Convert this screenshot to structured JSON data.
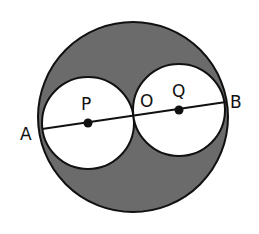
{
  "diagram": {
    "type": "geometry",
    "colors": {
      "background": "#ffffff",
      "shaded_region": "#6b6b6b",
      "stroke": "#111111",
      "inner_fill": "#ffffff"
    },
    "outer_circle": {
      "cx": 133,
      "cy": 117,
      "r": 95
    },
    "circle_p": {
      "cx": 88,
      "cy": 123,
      "r": 46
    },
    "circle_q": {
      "cx": 179,
      "cy": 110,
      "r": 46
    },
    "segment_ab": {
      "x1": 42,
      "y1": 129,
      "x2": 226,
      "y2": 102
    },
    "points": {
      "P": {
        "label": "P",
        "x": 88,
        "y": 123,
        "label_x": 81,
        "label_y": 110
      },
      "Q": {
        "label": "Q",
        "x": 179,
        "y": 110,
        "label_x": 172,
        "label_y": 97
      },
      "O": {
        "label": "O",
        "x": 133,
        "y": 117,
        "label_x": 140,
        "label_y": 107
      },
      "A": {
        "label": "A",
        "x": 42,
        "y": 129,
        "label_x": 20,
        "label_y": 140
      },
      "B": {
        "label": "B",
        "x": 226,
        "y": 102,
        "label_x": 230,
        "label_y": 108
      }
    }
  }
}
